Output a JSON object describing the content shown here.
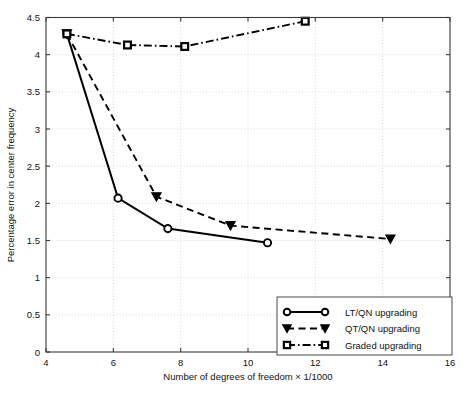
{
  "chart_data": {
    "type": "line",
    "title": "",
    "xlabel": "Number of degrees of freedom × 1/1000",
    "ylabel": "Percentage error in center frequency",
    "xlim": [
      4,
      16
    ],
    "ylim": [
      0,
      4.5
    ],
    "xticks": [
      4,
      6,
      8,
      10,
      12,
      14,
      16
    ],
    "yticks": [
      0,
      0.5,
      1,
      1.5,
      2,
      2.5,
      3,
      3.5,
      4,
      4.5
    ],
    "xtick_labels": [
      "4",
      "6",
      "8",
      "10",
      "12",
      "14",
      "16"
    ],
    "ytick_labels": [
      "0",
      "0.5",
      "1",
      "1.5",
      "2",
      "2.5",
      "3",
      "3.5",
      "4",
      "4.5"
    ],
    "grid": true,
    "legend_position": "lower right",
    "series": [
      {
        "name": "LT/QN upgrading",
        "marker": "circle",
        "linestyle": "solid",
        "color": "#000000",
        "points": [
          {
            "x": 4.62,
            "y": 4.28
          },
          {
            "x": 6.14,
            "y": 2.07
          },
          {
            "x": 7.62,
            "y": 1.66
          },
          {
            "x": 10.58,
            "y": 1.47
          }
        ]
      },
      {
        "name": "QT/QN upgrading",
        "marker": "triangle-down",
        "linestyle": "dashed",
        "color": "#000000",
        "points": [
          {
            "x": 4.62,
            "y": 4.28
          },
          {
            "x": 7.28,
            "y": 2.09
          },
          {
            "x": 9.48,
            "y": 1.7
          },
          {
            "x": 14.23,
            "y": 1.52
          }
        ]
      },
      {
        "name": "Graded upgrading",
        "marker": "square",
        "linestyle": "dash-dot",
        "color": "#000000",
        "points": [
          {
            "x": 4.62,
            "y": 4.28
          },
          {
            "x": 6.42,
            "y": 4.13
          },
          {
            "x": 8.12,
            "y": 4.11
          },
          {
            "x": 11.7,
            "y": 4.45
          }
        ]
      }
    ],
    "legend_entries": [
      {
        "label": "LT/QN upgrading",
        "marker": "circle",
        "linestyle": "solid"
      },
      {
        "label": "QT/QN upgrading",
        "marker": "triangle-down",
        "linestyle": "dashed"
      },
      {
        "label": "Graded upgrading",
        "marker": "square",
        "linestyle": "dash-dot"
      }
    ]
  }
}
